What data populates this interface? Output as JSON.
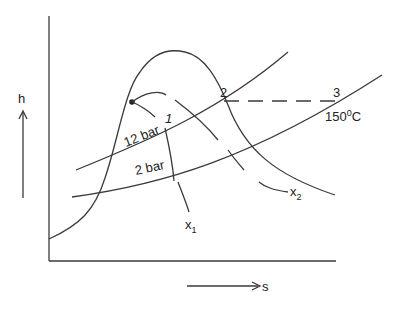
{
  "diagram": {
    "type": "h-s (Mollier) diagram",
    "axes": {
      "y_label": "h",
      "x_label": "s"
    },
    "isobars": [
      {
        "label": "12 bar"
      },
      {
        "label": "2 bar"
      }
    ],
    "points": {
      "p1": "1",
      "p2": "2",
      "p3": "3"
    },
    "temperature": {
      "value": "150",
      "sup": "0",
      "unit": "C"
    },
    "quality_lines": {
      "x1": {
        "base": "x",
        "sub": "1"
      },
      "x2": {
        "base": "x",
        "sub": "2"
      }
    },
    "colors": {
      "line": "#3a3a3a",
      "text": "#222222",
      "background": "#ffffff"
    }
  }
}
